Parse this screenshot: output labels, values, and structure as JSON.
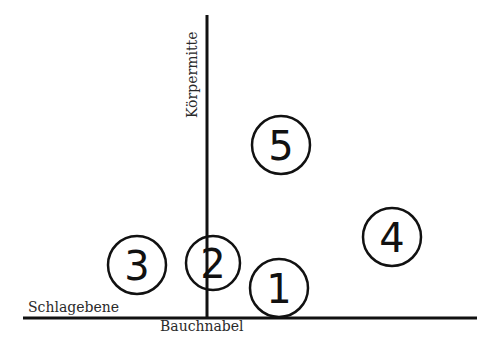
{
  "diagram": {
    "axes": {
      "vertical_label": "Körpermitte",
      "horizontal_label": "Schlagebene",
      "origin_label": "Bauchnabel"
    },
    "markers": [
      {
        "id": "1",
        "label": "1",
        "cx": 279,
        "cy": 288,
        "r": 29
      },
      {
        "id": "2",
        "label": "2",
        "cx": 213,
        "cy": 263,
        "r": 27
      },
      {
        "id": "3",
        "label": "3",
        "cx": 137,
        "cy": 265,
        "r": 29
      },
      {
        "id": "4",
        "label": "4",
        "cx": 392,
        "cy": 237,
        "r": 29
      },
      {
        "id": "5",
        "label": "5",
        "cx": 281,
        "cy": 145,
        "r": 29
      }
    ],
    "colors": {
      "line": "#111111",
      "text": "#2a2a2a",
      "background": "#ffffff"
    }
  }
}
